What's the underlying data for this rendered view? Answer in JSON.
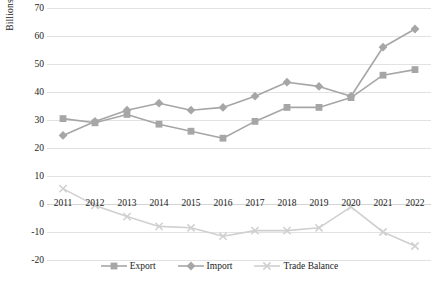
{
  "chart_data": {
    "type": "line",
    "title": "",
    "xlabel": "",
    "ylabel": "Billions",
    "ylim": [
      -20,
      70
    ],
    "ytick_step": 10,
    "grid": true,
    "legend_position": "bottom",
    "categories": [
      "2011",
      "2012",
      "2013",
      "2014",
      "2015",
      "2016",
      "2017",
      "2018",
      "2019",
      "2020",
      "2021",
      "2022"
    ],
    "yticks": [
      "70",
      "60",
      "50",
      "40",
      "30",
      "20",
      "10",
      "0",
      "-10",
      "-20"
    ],
    "series": [
      {
        "name": "Export",
        "marker": "square",
        "color": "#a6a6a6",
        "values": [
          30.5,
          29,
          32,
          28.5,
          26,
          23.5,
          29.5,
          34.5,
          34.5,
          38,
          46,
          48
        ]
      },
      {
        "name": "Import",
        "marker": "diamond",
        "color": "#a6a6a6",
        "values": [
          24.5,
          29.5,
          33.5,
          36,
          33.5,
          34.5,
          38.5,
          43.5,
          42,
          38.5,
          56,
          62.5
        ]
      },
      {
        "name": "Trade Balance",
        "marker": "x",
        "color": "#d0d0d0",
        "values": [
          5.5,
          -0.5,
          -4.5,
          -8,
          -8.5,
          -11.5,
          -9.5,
          -9.5,
          -8.5,
          -1,
          -10,
          -15
        ]
      }
    ]
  },
  "legend": {
    "items": [
      {
        "label": "Export"
      },
      {
        "label": "Import"
      },
      {
        "label": "Trade Balance"
      }
    ]
  },
  "colors": {
    "series_primary": "#a6a6a6",
    "series_light": "#d0d0d0",
    "gridline": "#e2e2e2",
    "text": "#1a1a1a"
  }
}
